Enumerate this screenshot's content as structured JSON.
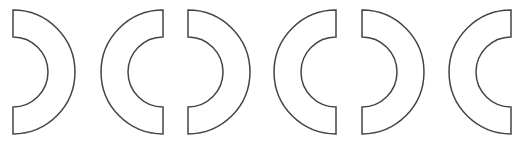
{
  "figure": {
    "stroke_color": "#444444",
    "fill_color": "#ffffff",
    "background": "#ffffff",
    "center_y": 72,
    "outer_radius": 62,
    "inner_radius": 35,
    "shapes": [
      {
        "id": 1,
        "facing": "right",
        "flat_x": 13
      },
      {
        "id": 2,
        "facing": "left",
        "flat_x": 163
      },
      {
        "id": 3,
        "facing": "right",
        "flat_x": 188
      },
      {
        "id": 4,
        "facing": "left",
        "flat_x": 336
      },
      {
        "id": 5,
        "facing": "right",
        "flat_x": 362
      },
      {
        "id": 6,
        "facing": "left",
        "flat_x": 511
      }
    ]
  }
}
